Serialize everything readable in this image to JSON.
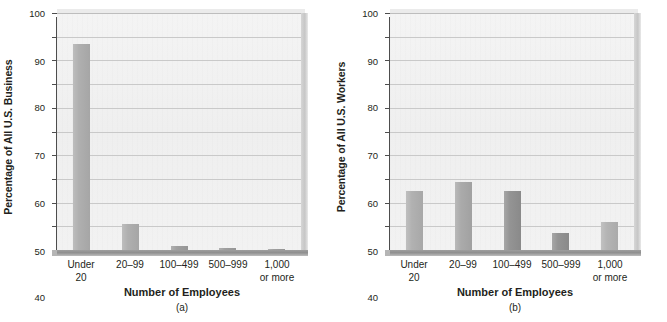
{
  "figure": {
    "background_color": "#ffffff",
    "plot_background_color": "#f1f1f1",
    "gridline_color": "#c9c9c9",
    "axis_color": "#4d4d4d",
    "floor_color": "#949494",
    "bar_color_light": "#b0b0b0",
    "bar_color_mid": "#a9a9a9",
    "bar_color_dark": "#8d8d8d"
  },
  "chart_data": [
    {
      "type": "bar",
      "panel": "a",
      "caption": "(a)",
      "title": "",
      "xlabel": "Number of Employees",
      "ylabel": "Percentage of All U.S. Business",
      "categories": [
        "Under 20",
        "20–99",
        "100–499",
        "500–999",
        "1,000 or more"
      ],
      "category_lines": [
        [
          "Under",
          "20"
        ],
        [
          "20–99",
          ""
        ],
        [
          "100–499",
          ""
        ],
        [
          "500–999",
          ""
        ],
        [
          "1,000",
          "or more"
        ]
      ],
      "values": [
        87,
        11,
        1.5,
        0.8,
        0.3
      ],
      "bar_colors": [
        "#ababab",
        "#ababab",
        "#9a9a9a",
        "#9a9a9a",
        "#9a9a9a"
      ],
      "ylim": [
        0,
        100
      ],
      "yticks": [
        0,
        10,
        20,
        30,
        40,
        50,
        60,
        70,
        80,
        90,
        100
      ],
      "ytick_labels": [
        "0",
        "10",
        "20",
        "30",
        "40",
        "50",
        "60",
        "70",
        "80",
        "90",
        "100"
      ],
      "grid": true,
      "legend": "none"
    },
    {
      "type": "bar",
      "panel": "b",
      "caption": "(b)",
      "title": "",
      "xlabel": "Number of Employees",
      "ylabel": "Percentage of All U.S. Workers",
      "categories": [
        "Under 20",
        "20–99",
        "100–499",
        "500–999",
        "1,000 or more"
      ],
      "category_lines": [
        [
          "Under",
          "20"
        ],
        [
          "20–99",
          ""
        ],
        [
          "100–499",
          ""
        ],
        [
          "500–999",
          ""
        ],
        [
          "1,000",
          "or more"
        ]
      ],
      "values": [
        25,
        28.5,
        24.7,
        7,
        12
      ],
      "bar_colors": [
        "#adadad",
        "#a6a6a6",
        "#8e8e8e",
        "#8e8e8e",
        "#b0b0b0"
      ],
      "ylim": [
        0,
        100
      ],
      "yticks": [
        0,
        10,
        20,
        30,
        40,
        50,
        60,
        70,
        80,
        90,
        100
      ],
      "ytick_labels": [
        "0",
        "10",
        "20",
        "30",
        "40",
        "50",
        "60",
        "70",
        "80",
        "90",
        "100"
      ],
      "grid": true,
      "legend": "none"
    }
  ]
}
